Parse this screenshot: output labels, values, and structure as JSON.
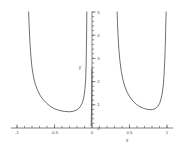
{
  "chart_data": {
    "type": "line",
    "title": "",
    "xlabel": "x",
    "ylabel": "y",
    "xlim": [
      -1.08,
      1.08
    ],
    "ylim": [
      0,
      5
    ],
    "grid": false,
    "legend": "none",
    "xticks": [
      -1,
      -0.5,
      0,
      0.5,
      1
    ],
    "xtick_labels": [
      "-1",
      "-0.5",
      "0",
      "0.5",
      "1"
    ],
    "yticks": [
      0,
      1,
      2,
      3,
      4,
      5
    ],
    "ytick_labels": [
      "0",
      "1",
      "2",
      "3",
      "4",
      "5"
    ],
    "xminor_step": 0.1,
    "yminor_step": 0.2,
    "line_color": "#3f3f3f",
    "axis_color": "#4d4d4d",
    "background_color": "#ffffff",
    "series": [
      {
        "name": "branch-left",
        "x": [
          -0.845,
          -0.84,
          -0.833,
          -0.825,
          -0.815,
          -0.8,
          -0.78,
          -0.755,
          -0.725,
          -0.69,
          -0.65,
          -0.6,
          -0.55,
          -0.5,
          -0.45,
          -0.4,
          -0.35,
          -0.3,
          -0.25,
          -0.2,
          -0.16,
          -0.13,
          -0.11,
          -0.095,
          -0.085,
          -0.078,
          -0.074,
          -0.071,
          -0.069
        ],
        "y": [
          5.0,
          4.55,
          4.05,
          3.55,
          3.1,
          2.6,
          2.2,
          1.88,
          1.62,
          1.4,
          1.22,
          1.05,
          0.92,
          0.83,
          0.77,
          0.73,
          0.71,
          0.7,
          0.72,
          0.78,
          0.9,
          1.08,
          1.3,
          1.65,
          2.1,
          2.75,
          3.5,
          4.3,
          5.0
        ]
      },
      {
        "name": "branch-origin",
        "x": [
          -0.012,
          -0.01,
          -0.008,
          -0.006,
          -0.005,
          -0.004,
          -0.003,
          -0.002,
          -0.0015,
          -0.001
        ],
        "y": [
          0.1,
          0.28,
          0.52,
          0.82,
          1.0,
          1.22,
          1.48,
          1.8,
          2.1,
          2.55
        ]
      },
      {
        "name": "branch-right",
        "x": [
          0.335,
          0.34,
          0.348,
          0.358,
          0.372,
          0.39,
          0.412,
          0.44,
          0.472,
          0.508,
          0.548,
          0.592,
          0.638,
          0.685,
          0.73,
          0.772,
          0.81,
          0.845,
          0.875,
          0.9,
          0.92,
          0.938,
          0.952,
          0.962,
          0.97,
          0.977,
          0.982,
          0.986,
          0.989
        ],
        "y": [
          5.0,
          4.5,
          3.95,
          3.4,
          2.9,
          2.45,
          2.08,
          1.77,
          1.52,
          1.32,
          1.15,
          1.02,
          0.92,
          0.85,
          0.81,
          0.79,
          0.8,
          0.84,
          0.92,
          1.05,
          1.25,
          1.52,
          1.9,
          2.35,
          2.9,
          3.55,
          4.2,
          4.7,
          5.0
        ]
      }
    ]
  }
}
